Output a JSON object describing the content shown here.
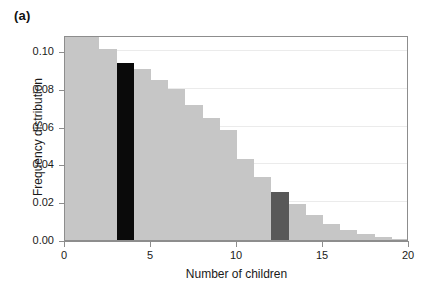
{
  "panel": {
    "label": "(a)"
  },
  "chart_data": {
    "type": "bar",
    "title": "",
    "subtitle": "",
    "xlabel": "Number of children",
    "ylabel": "Frequency distribution",
    "xlim": [
      0,
      20
    ],
    "ylim": [
      0.0,
      0.1085
    ],
    "grid": true,
    "grid_axis": "y",
    "legend": null,
    "bar_width_units": 1,
    "x_ticks": [
      0,
      5,
      10,
      15,
      20
    ],
    "x_ticklabels": [
      "0",
      "5",
      "10",
      "15",
      "20"
    ],
    "y_ticks": [
      0.0,
      0.02,
      0.04,
      0.06,
      0.08,
      0.1
    ],
    "y_ticklabels": [
      "0.00",
      "0.02",
      "0.04",
      "0.06",
      "0.08",
      "0.10"
    ],
    "categories": [
      "0-1",
      "1-2",
      "2-3",
      "3-4",
      "4-5",
      "5-6",
      "6-7",
      "7-8",
      "8-9",
      "9-10",
      "10-11",
      "11-12",
      "12-13",
      "13-14",
      "14-15",
      "15-16",
      "16-17",
      "17-18",
      "18-19",
      "19-20"
    ],
    "x": [
      0,
      1,
      2,
      3,
      4,
      5,
      6,
      7,
      8,
      9,
      10,
      11,
      12,
      13,
      14,
      15,
      16,
      17,
      18,
      19
    ],
    "values": [
      0.115,
      0.108,
      0.101,
      0.0935,
      0.0905,
      0.0845,
      0.08,
      0.0715,
      0.0645,
      0.058,
      0.043,
      0.0335,
      0.0255,
      0.019,
      0.0135,
      0.0085,
      0.0055,
      0.003,
      0.0015,
      0.0005
    ],
    "bar_colors": [
      "#c6c6c6",
      "#c6c6c6",
      "#c6c6c6",
      "#0a0a0a",
      "#c6c6c6",
      "#c6c6c6",
      "#c6c6c6",
      "#c6c6c6",
      "#c6c6c6",
      "#c6c6c6",
      "#c6c6c6",
      "#c6c6c6",
      "#585858",
      "#c6c6c6",
      "#c6c6c6",
      "#c6c6c6",
      "#c6c6c6",
      "#c6c6c6",
      "#c6c6c6",
      "#c6c6c6"
    ],
    "clipped_bars": [
      "0-1",
      "1-2"
    ],
    "highlighted": [
      {
        "category": "3-4",
        "value": 0.0935,
        "color": "#0a0a0a"
      },
      {
        "category": "12-13",
        "value": 0.0255,
        "color": "#585858"
      }
    ],
    "colors": {
      "bar_default": "#c6c6c6",
      "bar_black": "#0a0a0a",
      "bar_darkgray": "#585858",
      "axis": "#8d8d8d",
      "grid": "#ebebeb",
      "text": "#1a1a1a",
      "background": "#ffffff"
    }
  }
}
